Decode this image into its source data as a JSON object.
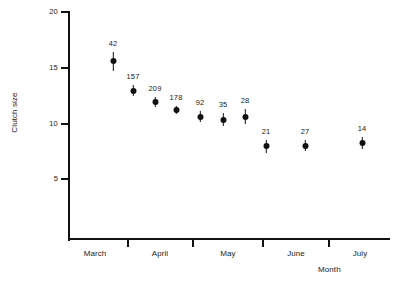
{
  "chart_data": {
    "type": "scatter",
    "title": "",
    "xlabel": "Month",
    "ylabel": "Clutch size",
    "ylim": [
      0,
      20
    ],
    "yticks": [
      20,
      15,
      10,
      5
    ],
    "grid": false,
    "legend": null,
    "categories": [
      "March",
      "April",
      "May",
      "June",
      "July"
    ],
    "series": [
      {
        "name": "Mean clutch size",
        "points": [
          {
            "label": "42",
            "x_px": 113,
            "y": 15.6,
            "err_low": 14.75,
            "err_high": 16.4
          },
          {
            "label": "157",
            "x_px": 133,
            "y": 12.95,
            "err_low": 12.45,
            "err_high": 13.45
          },
          {
            "label": "209",
            "x_px": 155,
            "y": 11.95,
            "err_low": 11.5,
            "err_high": 12.4
          },
          {
            "label": "178",
            "x_px": 176,
            "y": 11.2,
            "err_low": 10.85,
            "err_high": 11.55
          },
          {
            "label": "92",
            "x_px": 200,
            "y": 10.6,
            "err_low": 10.1,
            "err_high": 11.1
          },
          {
            "label": "35",
            "x_px": 223,
            "y": 10.35,
            "err_low": 9.8,
            "err_high": 10.95
          },
          {
            "label": "28",
            "x_px": 245,
            "y": 10.6,
            "err_low": 9.95,
            "err_high": 11.3
          },
          {
            "label": "21",
            "x_px": 266,
            "y": 7.95,
            "err_low": 7.35,
            "err_high": 8.55
          },
          {
            "label": "27",
            "x_px": 305,
            "y": 8.0,
            "err_low": 7.5,
            "err_high": 8.5
          },
          {
            "label": "14",
            "x_px": 362,
            "y": 8.25,
            "err_low": 7.7,
            "err_high": 8.8
          }
        ]
      }
    ],
    "xtick_positions_px": [
      127,
      192,
      262,
      328
    ],
    "xlabel_positions_px": [
      95,
      160,
      228,
      296,
      360
    ]
  }
}
